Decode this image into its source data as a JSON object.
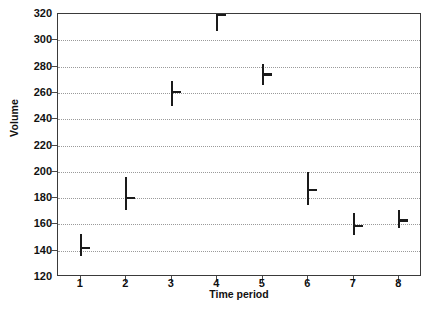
{
  "chart_data": {
    "type": "scatter",
    "title": "",
    "xlabel": "Time period",
    "ylabel": "Volume",
    "x": [
      1,
      2,
      3,
      4,
      5,
      6,
      7,
      8
    ],
    "categories": [
      "1",
      "2",
      "3",
      "4",
      "5",
      "6",
      "7",
      "8"
    ],
    "values": [
      142,
      180,
      261,
      319,
      274,
      186,
      159,
      163
    ],
    "series": [
      {
        "name": "Mean volume",
        "values": [
          142,
          180,
          261,
          319,
          274,
          186,
          159,
          163
        ],
        "error_low": [
          136,
          171,
          250,
          307,
          266,
          175,
          152,
          157
        ],
        "error_high": [
          153,
          196,
          269,
          325,
          282,
          200,
          169,
          171
        ]
      }
    ],
    "xlim": [
      0.5,
      8.5
    ],
    "ylim": [
      120,
      320
    ],
    "yticks": [
      120,
      140,
      160,
      180,
      200,
      220,
      240,
      260,
      280,
      300,
      320
    ],
    "xticks": [
      1,
      2,
      3,
      4,
      5,
      6,
      7,
      8
    ],
    "ytick_labels": [
      "120",
      "140",
      "160",
      "180",
      "200",
      "220",
      "240",
      "260",
      "280",
      "300",
      "320"
    ],
    "xtick_labels": [
      "1",
      "2",
      "3",
      "4",
      "5",
      "6",
      "7",
      "8"
    ],
    "grid": true,
    "grid_axis": "y",
    "grid_style": "dotted",
    "legend": false,
    "marker_style": "error-bar-with-mean-tick",
    "colors": {
      "marker": "#1a1a1a",
      "grid": "#9a9a9a",
      "axis": "#3a3a3a",
      "text": "#111111"
    }
  },
  "caption": {
    "text": ""
  }
}
